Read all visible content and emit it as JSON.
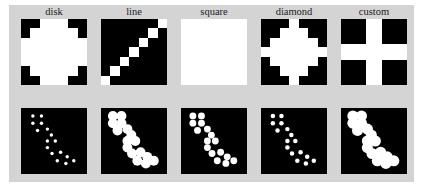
{
  "figure": {
    "title": "",
    "background_color": "#d4d4d4",
    "page_background": "#ffffff",
    "rows": 2,
    "cols": 5,
    "row_descriptions": [
      "structuring elements",
      "dilated point pattern"
    ]
  },
  "panels": [
    {
      "label": "disk",
      "se_kind": "disk",
      "se_size": 7,
      "foreground_color": "#ffffff",
      "background_color": "#000000"
    },
    {
      "label": "line",
      "se_kind": "line",
      "se_size": 7,
      "foreground_color": "#ffffff",
      "background_color": "#000000"
    },
    {
      "label": "square",
      "se_kind": "square",
      "se_size": 7,
      "foreground_color": "#ffffff",
      "background_color": "#000000"
    },
    {
      "label": "diamond",
      "se_kind": "diamond",
      "se_size": 7,
      "foreground_color": "#ffffff",
      "background_color": "#000000"
    },
    {
      "label": "custom",
      "se_kind": "cross",
      "se_size": 7,
      "foreground_color": "#ffffff",
      "background_color": "#000000"
    }
  ],
  "chart_data": {
    "type": "heatmap",
    "title": "",
    "xlabel": "",
    "ylabel": "",
    "grid": false,
    "legend": "none",
    "categories": [
      "disk",
      "line",
      "square",
      "diamond",
      "custom"
    ],
    "structuring_elements": {
      "grid_size": 7,
      "disk": [
        [
          0,
          0,
          1,
          1,
          1,
          0,
          0
        ],
        [
          0,
          1,
          1,
          1,
          1,
          1,
          0
        ],
        [
          1,
          1,
          1,
          1,
          1,
          1,
          1
        ],
        [
          1,
          1,
          1,
          1,
          1,
          1,
          1
        ],
        [
          1,
          1,
          1,
          1,
          1,
          1,
          1
        ],
        [
          0,
          1,
          1,
          1,
          1,
          1,
          0
        ],
        [
          0,
          0,
          1,
          1,
          1,
          0,
          0
        ]
      ],
      "line": [
        [
          0,
          0,
          0,
          0,
          0,
          0,
          1
        ],
        [
          0,
          0,
          0,
          0,
          0,
          1,
          0
        ],
        [
          0,
          0,
          0,
          0,
          1,
          0,
          0
        ],
        [
          0,
          0,
          0,
          1,
          0,
          0,
          0
        ],
        [
          0,
          0,
          1,
          0,
          0,
          0,
          0
        ],
        [
          0,
          1,
          0,
          0,
          0,
          0,
          0
        ],
        [
          1,
          0,
          0,
          0,
          0,
          0,
          0
        ]
      ],
      "square": [
        [
          1,
          1,
          1,
          1,
          1,
          1,
          1
        ],
        [
          1,
          1,
          1,
          1,
          1,
          1,
          1
        ],
        [
          1,
          1,
          1,
          1,
          1,
          1,
          1
        ],
        [
          1,
          1,
          1,
          1,
          1,
          1,
          1
        ],
        [
          1,
          1,
          1,
          1,
          1,
          1,
          1
        ],
        [
          1,
          1,
          1,
          1,
          1,
          1,
          1
        ],
        [
          1,
          1,
          1,
          1,
          1,
          1,
          1
        ]
      ],
      "diamond": [
        [
          0,
          0,
          0,
          1,
          0,
          0,
          0
        ],
        [
          0,
          0,
          1,
          1,
          1,
          0,
          0
        ],
        [
          0,
          1,
          1,
          1,
          1,
          1,
          0
        ],
        [
          1,
          1,
          1,
          1,
          1,
          1,
          1
        ],
        [
          0,
          1,
          1,
          1,
          1,
          1,
          0
        ],
        [
          0,
          0,
          1,
          1,
          1,
          0,
          0
        ],
        [
          0,
          0,
          0,
          1,
          0,
          0,
          0
        ]
      ],
      "custom": [
        [
          0,
          0,
          1,
          1,
          1,
          0,
          0
        ],
        [
          0,
          0,
          1,
          1,
          1,
          0,
          0
        ],
        [
          1,
          1,
          1,
          1,
          1,
          1,
          1
        ],
        [
          1,
          1,
          1,
          1,
          1,
          1,
          1
        ],
        [
          1,
          1,
          1,
          1,
          1,
          1,
          1
        ],
        [
          0,
          0,
          1,
          1,
          1,
          0,
          0
        ],
        [
          0,
          0,
          1,
          1,
          1,
          0,
          0
        ]
      ]
    },
    "source_points": [
      [
        0.18,
        0.12
      ],
      [
        0.31,
        0.12
      ],
      [
        0.18,
        0.23
      ],
      [
        0.31,
        0.23
      ],
      [
        0.4,
        0.32
      ],
      [
        0.46,
        0.41
      ],
      [
        0.4,
        0.5
      ],
      [
        0.52,
        0.5
      ],
      [
        0.4,
        0.6
      ],
      [
        0.47,
        0.69
      ],
      [
        0.6,
        0.67
      ],
      [
        0.7,
        0.74
      ],
      [
        0.55,
        0.8
      ],
      [
        0.68,
        0.84
      ],
      [
        0.8,
        0.8
      ],
      [
        0.25,
        0.34
      ]
    ],
    "point_radius": 0.022
  }
}
